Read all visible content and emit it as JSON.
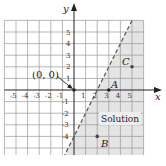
{
  "graph": {
    "inequality": "y < 2x - 4",
    "boundary_line": {
      "equation": "y = 2x - 4",
      "style": "dashed"
    },
    "axes": {
      "x_label": "x",
      "y_label": "y",
      "x_ticks": [
        "-5",
        "-4",
        "-3",
        "-2",
        "-1",
        "1",
        "2",
        "3",
        "4",
        "5"
      ],
      "y_ticks_pos": [
        "1",
        "2",
        "3",
        "4",
        "5"
      ],
      "y_ticks_neg": [
        "-1",
        "-2",
        "-3",
        "-4"
      ]
    },
    "points": [
      {
        "name": "origin",
        "label": "(0, 0)",
        "x": 0,
        "y": 0
      },
      {
        "name": "A",
        "label": "A",
        "x": 3,
        "y": 0
      },
      {
        "name": "B",
        "label": "B",
        "x": 2,
        "y": -4
      },
      {
        "name": "C",
        "label": "C",
        "x": 5,
        "y": 2
      }
    ],
    "region_label": "Solution",
    "colors": {
      "shade": "#e4e4e4",
      "grid": "#9a9a9a",
      "axis": "#222222",
      "line": "#555555",
      "label_box": "#eeeeee"
    }
  }
}
